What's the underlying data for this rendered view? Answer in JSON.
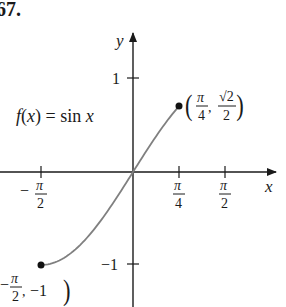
{
  "problem_number": "67.",
  "function_label": {
    "f": "f",
    "open": "(",
    "x": "x",
    "close": ")",
    "eq": " = sin ",
    "x2": "x"
  },
  "axes": {
    "x_label": "x",
    "y_label": "y",
    "x_ticks": [
      {
        "num": "π",
        "den": "2",
        "sign": "−",
        "value": -1.5708
      },
      {
        "num": "π",
        "den": "4",
        "sign": "",
        "value": 0.7854
      },
      {
        "num": "π",
        "den": "2",
        "sign": "",
        "value": 1.5708
      }
    ],
    "y_ticks": [
      {
        "label": "1",
        "value": 1
      },
      {
        "label": "−1",
        "value": -1
      }
    ]
  },
  "points": [
    {
      "label_num_x": "π",
      "label_den_x": "4",
      "label_num_y": "√2",
      "label_den_y": "2",
      "x": 0.7854,
      "y": 0.7071
    },
    {
      "label_num_x": "π",
      "label_den_x": "2",
      "label_sign_x": "−",
      "label_y": "−1",
      "x": -1.5708,
      "y": -1
    }
  ],
  "colors": {
    "axis": "#1a1a1a",
    "curve": "#808080",
    "point": "#111111"
  },
  "chart_data": {
    "type": "line",
    "title": "f(x) = sin x",
    "xlabel": "x",
    "ylabel": "y",
    "domain": [
      -1.5708,
      0.7854
    ],
    "series": [
      {
        "name": "sin x",
        "x": [
          -1.5708,
          -1.1781,
          -0.7854,
          -0.3927,
          0,
          0.3927,
          0.7854
        ],
        "values": [
          -1,
          -0.9239,
          -0.7071,
          -0.3827,
          0,
          0.3827,
          0.7071
        ]
      }
    ],
    "endpoints": [
      {
        "x": -1.5708,
        "y": -1,
        "label": "(−π/2, −1)"
      },
      {
        "x": 0.7854,
        "y": 0.7071,
        "label": "(π/4, √2/2)"
      }
    ],
    "x_ticks": [
      "−π/2",
      "π/4",
      "π/2"
    ],
    "y_ticks": [
      "1",
      "−1"
    ],
    "grid": false
  }
}
